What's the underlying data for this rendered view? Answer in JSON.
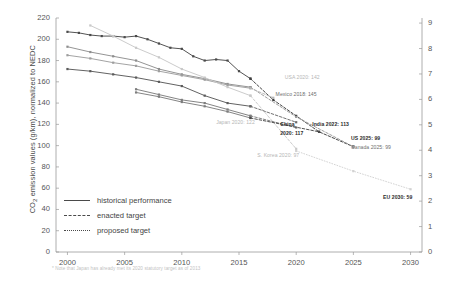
{
  "chart_data": {
    "type": "line",
    "title": "",
    "xlabel": "",
    "ylabel": "CO₂ emission values (g/km), normalized to NEDC",
    "ylabel_right": "Fuel consumption (l/100 km gasoline equivalent)",
    "xlim": [
      1999,
      2031
    ],
    "ylim": [
      0,
      220
    ],
    "ylim_right": [
      0,
      9.2
    ],
    "grid": false,
    "legend_position": "lower-left",
    "xticks": [
      2000,
      2005,
      2010,
      2015,
      2020,
      2025,
      2030
    ],
    "yticks_left": [
      0,
      20,
      40,
      60,
      80,
      100,
      120,
      140,
      160,
      180,
      200,
      220
    ],
    "yticks_right": [
      0,
      1,
      2,
      3,
      4,
      5,
      6,
      7,
      8,
      9
    ],
    "legend": [
      {
        "label": "historical performance",
        "style": "solid"
      },
      {
        "label": "enacted target",
        "style": "dashed"
      },
      {
        "label": "proposed target",
        "style": "dotted"
      }
    ],
    "footnote": "* Note that Japan has already met its 2020 statutory target as of 2013",
    "series": [
      {
        "name": "US",
        "color": "#4a4a4a",
        "style": "solid",
        "x": [
          2000,
          2001,
          2002,
          2003,
          2004,
          2005,
          2006,
          2007,
          2008,
          2009,
          2010,
          2011,
          2012,
          2013,
          2014,
          2015,
          2016
        ],
        "y": [
          207,
          206,
          204,
          203,
          203,
          202,
          203,
          200,
          196,
          192,
          191,
          184,
          180,
          181,
          180,
          170,
          163
        ]
      },
      {
        "name": "US-target",
        "color": "#3c3c3c",
        "style": "dashed",
        "x": [
          2016,
          2018,
          2020,
          2022,
          2025
        ],
        "y": [
          163,
          143,
          128,
          113,
          99
        ]
      },
      {
        "name": "Canada",
        "color": "#8e8e8e",
        "style": "solid",
        "x": [
          2000,
          2002,
          2004,
          2006,
          2008,
          2010,
          2012,
          2014,
          2016
        ],
        "y": [
          193,
          188,
          184,
          180,
          172,
          167,
          163,
          158,
          155
        ]
      },
      {
        "name": "Canada-target",
        "color": "#9a9a9a",
        "style": "dashed",
        "x": [
          2016,
          2020,
          2025
        ],
        "y": [
          155,
          127,
          99
        ]
      },
      {
        "name": "Mexico",
        "color": "#9e9e9e",
        "style": "solid",
        "x": [
          2000,
          2002,
          2004,
          2006,
          2008,
          2010,
          2012,
          2014,
          2016
        ],
        "y": [
          185,
          182,
          178,
          175,
          170,
          166,
          162,
          157,
          154
        ]
      },
      {
        "name": "Mexico-target",
        "color": "#b5b5b5",
        "style": "dashed",
        "x": [
          2016,
          2018
        ],
        "y": [
          154,
          145
        ]
      },
      {
        "name": "S. Korea",
        "color": "#c8c8c8",
        "style": "solid",
        "x": [
          2002,
          2004,
          2006,
          2008,
          2010,
          2012,
          2014,
          2016
        ],
        "y": [
          213,
          203,
          192,
          183,
          172,
          164,
          155,
          147
        ]
      },
      {
        "name": "S. Korea-target",
        "color": "#c8c8c8",
        "style": "dashed",
        "x": [
          2016,
          2020
        ],
        "y": [
          147,
          97
        ]
      },
      {
        "name": "Japan",
        "color": "#5a5a5a",
        "style": "solid",
        "x": [
          2000,
          2002,
          2004,
          2006,
          2008,
          2010,
          2012,
          2014,
          2016
        ],
        "y": [
          172,
          170,
          167,
          164,
          160,
          156,
          147,
          140,
          137
        ]
      },
      {
        "name": "Japan-target",
        "color": "#6a6a6a",
        "style": "dashed",
        "x": [
          2016,
          2020
        ],
        "y": [
          137,
          122
        ]
      },
      {
        "name": "China",
        "color": "#7d7d7d",
        "style": "solid",
        "x": [
          2006,
          2008,
          2010,
          2012,
          2014,
          2016
        ],
        "y": [
          153,
          148,
          143,
          140,
          134,
          128
        ]
      },
      {
        "name": "China-target",
        "color": "#7d7d7d",
        "style": "dashed",
        "x": [
          2016,
          2020
        ],
        "y": [
          128,
          117
        ]
      },
      {
        "name": "India",
        "color": "#7d7d7d",
        "style": "solid",
        "x": [
          2006,
          2008,
          2010,
          2012,
          2014,
          2016
        ],
        "y": [
          150,
          146,
          141,
          137,
          132,
          126
        ]
      },
      {
        "name": "India-target",
        "color": "#4a4a4a",
        "style": "dashed",
        "x": [
          2016,
          2022
        ],
        "y": [
          126,
          113
        ]
      },
      {
        "name": "EU",
        "color": "#d2d2d2",
        "style": "dotted",
        "x": [
          2020,
          2025,
          2030
        ],
        "y": [
          95,
          76,
          59
        ]
      }
    ],
    "annotations": [
      {
        "text": "Japan 2020: 122",
        "x": 2013.0,
        "y": 122,
        "tone": "light"
      },
      {
        "text": "S. Korea 2020: 97",
        "x": 2016.6,
        "y": 91,
        "tone": "light"
      },
      {
        "text": "USA 2020: 142",
        "x": 2019.0,
        "y": 165,
        "tone": "light"
      },
      {
        "text": "Mexico 2018: 145",
        "x": 2018.2,
        "y": 149,
        "tone": "mid"
      },
      {
        "text": "China",
        "x": 2018.6,
        "y": 120,
        "tone": "dark"
      },
      {
        "text": "2020: 117",
        "x": 2018.6,
        "y": 112,
        "tone": "dark"
      },
      {
        "text": "India 2022: 113",
        "x": 2021.4,
        "y": 120,
        "tone": "dark"
      },
      {
        "text": "US 2025: 99",
        "x": 2024.8,
        "y": 107,
        "tone": "dark"
      },
      {
        "text": "Canada 2025: 99",
        "x": 2024.8,
        "y": 99,
        "tone": "mid"
      },
      {
        "text": "EU 2030: 59",
        "x": 2027.6,
        "y": 52,
        "tone": "dark"
      }
    ]
  }
}
